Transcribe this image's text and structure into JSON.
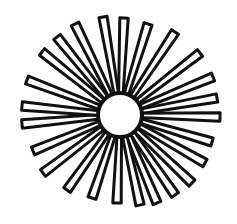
{
  "image": {
    "subject": "sunburst line drawing",
    "description": "Black-and-white hand-drawn sunburst: white circular center with outlined rays radiating outward",
    "colors": {
      "ink": "#111111",
      "paper": "#ffffff"
    },
    "hub": {
      "cx": 120,
      "cy": 115,
      "r": 22
    },
    "ray_tips": [
      [
        103,
        17
      ],
      [
        124,
        18
      ],
      [
        148,
        24
      ],
      [
        175,
        32
      ],
      [
        200,
        53
      ],
      [
        213,
        77
      ],
      [
        217,
        98
      ],
      [
        220,
        117
      ],
      [
        212,
        142
      ],
      [
        205,
        163
      ],
      [
        192,
        183
      ],
      [
        175,
        195
      ],
      [
        157,
        203
      ],
      [
        140,
        205
      ],
      [
        117,
        203
      ],
      [
        92,
        198
      ],
      [
        67,
        190
      ],
      [
        43,
        173
      ],
      [
        33,
        151
      ],
      [
        22,
        124
      ],
      [
        22,
        106
      ],
      [
        27,
        80
      ],
      [
        42,
        52
      ],
      [
        57,
        37
      ],
      [
        75,
        24
      ]
    ]
  }
}
